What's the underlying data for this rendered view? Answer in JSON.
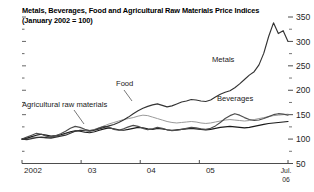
{
  "chart_data": {
    "type": "line",
    "title": "Metals, Beverages, Food and Agricultural Raw Materials Price Indices",
    "subtitle": "(January 2002 = 100)",
    "xlabel": "",
    "ylabel": "",
    "ylim": [
      50,
      350
    ],
    "yticks": [
      50,
      100,
      150,
      200,
      250,
      300,
      350
    ],
    "ytick_labels": [
      "50",
      "100",
      "150",
      "200",
      "250",
      "300",
      "350"
    ],
    "y_minor_step": 25,
    "grid": false,
    "legend_position": "inline-annotations",
    "axis_side": "right",
    "xtick_labels": [
      "2002",
      "03",
      "04",
      "05",
      "Jul.\n06"
    ],
    "x_tick_years": [
      2002,
      2003,
      2004,
      2005,
      2006.5
    ],
    "x_range": [
      2002,
      2006.5
    ],
    "annotations": [
      {
        "label": "Metals",
        "x": 212,
        "y": 62
      },
      {
        "label": "Food",
        "x": 116,
        "y": 86
      },
      {
        "label": "Beverages",
        "x": 217,
        "y": 101
      },
      {
        "label": "Agricultural raw materials",
        "x": 22,
        "y": 107
      }
    ],
    "series": [
      {
        "name": "Metals",
        "color": "#333333",
        "values": [
          100,
          99,
          101,
          103,
          104,
          103,
          102,
          104,
          106,
          108,
          112,
          116,
          118,
          117,
          116,
          118,
          121,
          124,
          127,
          130,
          134,
          139,
          145,
          152,
          158,
          163,
          167,
          170,
          172,
          169,
          166,
          168,
          172,
          176,
          178,
          181,
          180,
          178,
          177,
          180,
          186,
          192,
          196,
          199,
          205,
          213,
          222,
          231,
          238,
          252,
          276,
          310,
          338,
          316,
          322,
          300
        ]
      },
      {
        "name": "Beverages",
        "color": "#4d4d4d",
        "values": [
          100,
          104,
          108,
          112,
          110,
          106,
          104,
          107,
          111,
          116,
          122,
          126,
          124,
          120,
          117,
          119,
          123,
          126,
          124,
          120,
          118,
          121,
          125,
          128,
          126,
          122,
          119,
          121,
          124,
          122,
          119,
          117,
          118,
          120,
          122,
          124,
          123,
          121,
          120,
          122,
          127,
          134,
          142,
          148,
          152,
          149,
          144,
          140,
          138,
          139,
          142,
          146,
          150,
          152,
          151,
          149
        ]
      },
      {
        "name": "Food",
        "color": "#9a9a9a",
        "values": [
          100,
          101,
          103,
          104,
          103,
          102,
          103,
          105,
          108,
          111,
          114,
          116,
          118,
          119,
          118,
          120,
          123,
          127,
          131,
          134,
          137,
          140,
          142,
          144,
          147,
          149,
          148,
          145,
          142,
          139,
          136,
          134,
          133,
          134,
          135,
          136,
          135,
          133,
          132,
          133,
          135,
          137,
          139,
          140,
          139,
          138,
          137,
          138,
          140,
          142,
          144,
          146,
          148,
          149,
          150,
          151
        ]
      },
      {
        "name": "Agricultural raw materials",
        "color": "#1a1a1a",
        "values": [
          100,
          102,
          105,
          108,
          110,
          108,
          106,
          107,
          109,
          112,
          115,
          117,
          116,
          114,
          113,
          115,
          118,
          121,
          123,
          121,
          119,
          118,
          120,
          122,
          124,
          123,
          121,
          120,
          122,
          121,
          119,
          118,
          119,
          120,
          121,
          122,
          121,
          120,
          119,
          120,
          122,
          124,
          125,
          126,
          125,
          124,
          123,
          124,
          126,
          128,
          130,
          132,
          133,
          134,
          135,
          136
        ]
      }
    ]
  }
}
